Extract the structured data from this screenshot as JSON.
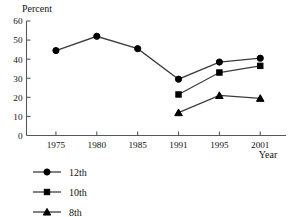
{
  "chart_data": {
    "type": "line",
    "title": "",
    "subtitle": "",
    "xlabel": "Year",
    "ylabel": "Percent",
    "x": [
      1975,
      1980,
      1985,
      1991,
      1995,
      2001
    ],
    "categories": [
      "1975",
      "1980",
      "1985",
      "1991",
      "1995",
      "2001"
    ],
    "xtick_labels": [
      "1975",
      "1980",
      "1985",
      "1991",
      "1995",
      "2001"
    ],
    "ytick_labels": [
      "60",
      "50",
      "40",
      "30",
      "20",
      "10",
      "0"
    ],
    "ytick_values": [
      60,
      50,
      40,
      30,
      20,
      10,
      0
    ],
    "ylim": [
      0,
      60
    ],
    "grid": false,
    "legend_position": "bottom-left",
    "annotations": [],
    "series": [
      {
        "name": "12th",
        "marker": "circle",
        "color": "#000000",
        "x": [
          1975,
          1980,
          1985,
          1991,
          1995,
          2001
        ],
        "values": [
          44.5,
          52.0,
          45.5,
          29.5,
          38.5,
          40.5
        ]
      },
      {
        "name": "10th",
        "marker": "square",
        "color": "#000000",
        "x": [
          1991,
          1995,
          2001
        ],
        "values": [
          21.5,
          33.0,
          36.5
        ]
      },
      {
        "name": "8th",
        "marker": "triangle",
        "color": "#000000",
        "x": [
          1991,
          1995,
          2001
        ],
        "values": [
          12.0,
          21.0,
          19.5
        ]
      }
    ]
  },
  "axes": {
    "y_title": "Percent",
    "x_title": "Year"
  },
  "legend": {
    "items": [
      {
        "label": "12th",
        "marker": "circle"
      },
      {
        "label": "10th",
        "marker": "square"
      },
      {
        "label": "8th",
        "marker": "triangle"
      }
    ]
  }
}
